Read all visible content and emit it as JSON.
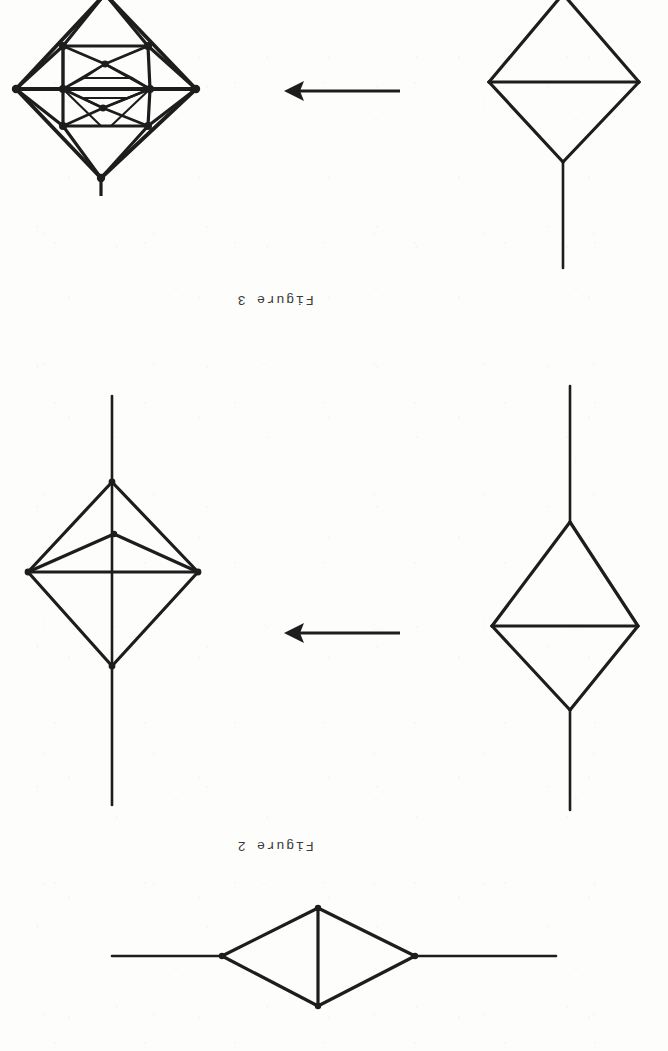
{
  "page": {
    "kind": "scanned-document-page",
    "orientation": "rotated-180",
    "width": 668,
    "height": 1051,
    "background_color": "#fdfdfc",
    "ink_color": "#1d1d1d"
  },
  "captions": {
    "figure3": "Figure 3",
    "figure2": "Figure 2"
  },
  "figures": [
    {
      "id": "figure-3",
      "caption": "Figure 3",
      "arrow": {
        "direction": "left",
        "glyph": "arrow-left"
      },
      "panels": [
        {
          "id": "figure-3-result",
          "position": "left",
          "description": "octahedral graph with recursively nested triangular subdivisions and a pendant tail",
          "node_count": 13,
          "has_tail": true,
          "tail_direction": "down"
        },
        {
          "id": "figure-3-source",
          "position": "right",
          "description": "rhombus with horizontal chord and a pendant tail",
          "node_count": 4,
          "has_tail": true,
          "tail_direction": "down"
        }
      ]
    },
    {
      "id": "figure-2",
      "caption": "Figure 2",
      "arrow": {
        "direction": "left",
        "glyph": "arrow-left"
      },
      "panels": [
        {
          "id": "figure-2-result",
          "position": "left",
          "description": "rhombus with vertical axis through it, horizontal chord and an inner apex node forming a triangle, tails up and down",
          "node_count": 5,
          "has_tail": true,
          "tail_direction": "up-and-down"
        },
        {
          "id": "figure-2-source",
          "position": "right",
          "description": "rhombus with horizontal chord, tails up and down",
          "node_count": 4,
          "has_tail": true,
          "tail_direction": "up-and-down"
        }
      ]
    },
    {
      "id": "figure-1",
      "caption": null,
      "panels": [
        {
          "id": "figure-1-graph",
          "position": "bottom",
          "description": "horizontal rhombus with a vertical chord and horizontal tails left and right",
          "node_count": 4,
          "has_tail": true,
          "tail_direction": "left-and-right"
        }
      ]
    }
  ]
}
